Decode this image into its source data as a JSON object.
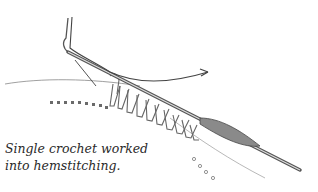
{
  "figure": {
    "caption_lines": [
      "Single crochet worked",
      "into hemstitching."
    ]
  },
  "colors": {
    "line": "#555555",
    "stitch": "#777777",
    "hole": "#6a6a6a",
    "text": "#2a2a2a"
  }
}
